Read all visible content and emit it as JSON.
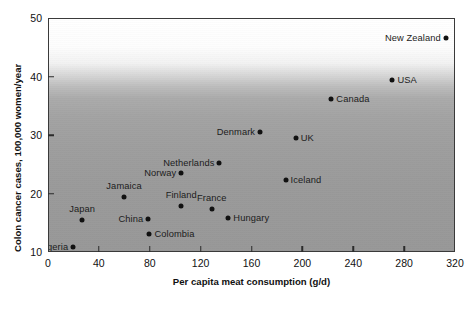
{
  "chart_data": {
    "type": "scatter",
    "title": "",
    "xlabel": "Per capita meat consumption (g/d)",
    "ylabel": "Colon cancer cases, 100,000 women/year",
    "xlim": [
      0,
      320
    ],
    "ylim": [
      10,
      50
    ],
    "xticks": [
      0,
      40,
      80,
      120,
      160,
      200,
      240,
      280,
      320
    ],
    "yticks": [
      10,
      20,
      30,
      40,
      50
    ],
    "grid": false,
    "legend": false,
    "marker_color": "#111111",
    "points": [
      {
        "label": "Nigeria",
        "x": 19,
        "y": 11.1,
        "label_side": "left"
      },
      {
        "label": "Japan",
        "x": 26,
        "y": 15.7,
        "label_side": "top"
      },
      {
        "label": "Jamaica",
        "x": 59,
        "y": 19.6,
        "label_side": "top"
      },
      {
        "label": "China",
        "x": 78,
        "y": 15.8,
        "label_side": "left"
      },
      {
        "label": "Colombia",
        "x": 79,
        "y": 13.2,
        "label_side": "right"
      },
      {
        "label": "Finland",
        "x": 104,
        "y": 18.0,
        "label_side": "top"
      },
      {
        "label": "Norway",
        "x": 104,
        "y": 23.6,
        "label_side": "left"
      },
      {
        "label": "Netherlands",
        "x": 134,
        "y": 25.4,
        "label_side": "left"
      },
      {
        "label": "France",
        "x": 128,
        "y": 17.5,
        "label_side": "top"
      },
      {
        "label": "Hungary",
        "x": 141,
        "y": 15.9,
        "label_side": "right"
      },
      {
        "label": "Denmark",
        "x": 166,
        "y": 30.6,
        "label_side": "left"
      },
      {
        "label": "UK",
        "x": 194,
        "y": 29.7,
        "label_side": "right"
      },
      {
        "label": "Iceland",
        "x": 186,
        "y": 22.4,
        "label_side": "right"
      },
      {
        "label": "Canada",
        "x": 222,
        "y": 36.4,
        "label_side": "right"
      },
      {
        "label": "USA",
        "x": 270,
        "y": 39.6,
        "label_side": "right"
      },
      {
        "label": "New Zealand",
        "x": 312,
        "y": 46.7,
        "label_side": "left"
      }
    ]
  }
}
